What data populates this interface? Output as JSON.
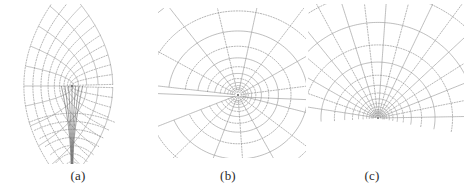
{
  "figure": {
    "width": 468,
    "height": 190,
    "background": "#ffffff",
    "kind": "multi-panel-line-figure"
  },
  "style": {
    "solid_color": "#9a9a9a",
    "dotted_color": "#8d8d8d",
    "dark_color": "#6f6f6f",
    "node_color": "#6a6a6a",
    "line_width": 0.65,
    "dash_pattern": "1.2 1.5"
  },
  "panels": [
    {
      "id": "a",
      "caption": "(a)",
      "caption_x": 78,
      "caption_y": 168,
      "box": {
        "x": 6,
        "y": 4,
        "width": 144,
        "height": 160
      },
      "grid_type": "hyperbolic-saddle",
      "center": {
        "x": 72,
        "y": 86
      },
      "notes": "Saddle / critical point; one family fans outward above, a narrow channel of near-vertical lines collapses toward the bottom",
      "chart_data": {
        "type": "line",
        "title": "(a)",
        "family_solid": {
          "name": "u-curves",
          "count": 11,
          "kind": "arcs-fanning-from-saddle",
          "params": {
            "k_min": -1.0,
            "k_max": 1.0
          }
        },
        "family_dotted": {
          "name": "v-curves",
          "count": 11,
          "kind": "orthogonal-arcs",
          "params": {
            "k_min": -1.0,
            "k_max": 1.0
          }
        },
        "singularity": {
          "x": 72,
          "y": 86,
          "type": "saddle"
        },
        "channel": {
          "x": 72,
          "y_top": 86,
          "y_bottom": 164,
          "half_width": 3
        }
      }
    },
    {
      "id": "b",
      "caption": "(b)",
      "caption_x": 228,
      "caption_y": 168,
      "box": {
        "x": 158,
        "y": 8,
        "width": 148,
        "height": 150
      },
      "grid_type": "focus-radial",
      "center": {
        "x": 238,
        "y": 95
      },
      "notes": "Rays emanating from an interior focus with nested orthogonal arcs opening to the right; grid tilted",
      "chart_data": {
        "type": "line",
        "title": "(b)",
        "family_solid": {
          "name": "radial-rays",
          "count": 15,
          "kind": "rays",
          "angle_start_deg": -165,
          "angle_end_deg": 165
        },
        "family_dotted": {
          "name": "nested-arcs",
          "count": 12,
          "kind": "concentric-arcs",
          "r_min": 6,
          "r_max": 120
        },
        "singularity": {
          "x": 238,
          "y": 95,
          "type": "focus"
        },
        "rotation_deg": -8
      }
    },
    {
      "id": "c",
      "caption": "(c)",
      "caption_x": 372,
      "caption_y": 168,
      "box": {
        "x": 308,
        "y": 4,
        "width": 156,
        "height": 158
      },
      "grid_type": "polar-concentric",
      "center": {
        "x": 378,
        "y": 118
      },
      "notes": "Concentric circular rings crossed by radial spokes, centre low in the frame",
      "chart_data": {
        "type": "line",
        "title": "(c)",
        "family_solid": {
          "name": "radial-spokes",
          "count": 17,
          "kind": "rays",
          "angle_start_deg": 185,
          "angle_end_deg": 355
        },
        "family_dotted": {
          "name": "concentric-rings",
          "count": 13,
          "kind": "circles",
          "r_min": 5,
          "r_max": 125
        },
        "singularity": {
          "x": 378,
          "y": 118,
          "type": "centre"
        },
        "rotation_deg": 4
      }
    }
  ],
  "captions": {
    "a": "(a)",
    "b": "(b)",
    "c": "(c)"
  }
}
